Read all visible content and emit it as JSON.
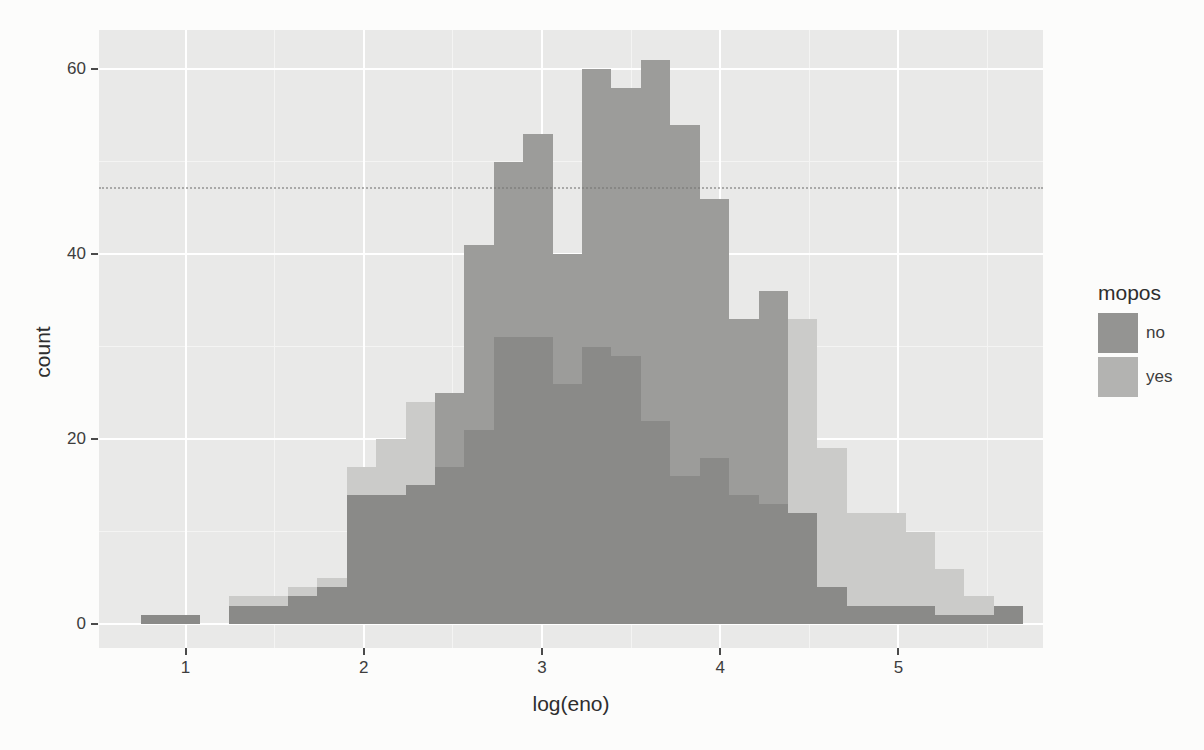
{
  "page": {
    "background": "#fcfcfb"
  },
  "panel": {
    "background": "#e9e9e8",
    "gridline_major_color": "#ffffff",
    "gridline_minor_color": "#f4f4f3"
  },
  "colors": {
    "no_only": "#9c9c9a",
    "yes_only": "#cbcbc9",
    "overlap": "#8a8a88",
    "axis_text": "#3d3d3d",
    "tick_mark": "#4a4a4a",
    "artifact_line": "#767674"
  },
  "axes": {
    "x": {
      "title": "log(eno)",
      "tick_labels": [
        "1",
        "2",
        "3",
        "4",
        "5"
      ],
      "tick_values": [
        1,
        2,
        3,
        4,
        5
      ],
      "minor_tick_values": [
        1.5,
        2.5,
        3.5,
        4.5,
        5.5
      ]
    },
    "y": {
      "title": "count",
      "tick_labels": [
        "0",
        "20",
        "40",
        "60"
      ],
      "tick_values": [
        0,
        20,
        40,
        60
      ],
      "minor_tick_values": [
        10,
        30,
        50
      ]
    }
  },
  "legend": {
    "title": "mopos",
    "items": [
      {
        "label": "no",
        "color": "#949492"
      },
      {
        "label": "yes",
        "color": "#b3b3b1"
      }
    ]
  },
  "chart_data": {
    "type": "bar",
    "subtype": "overlaid-histogram-position-identity",
    "title": "",
    "xlabel": "log(eno)",
    "ylabel": "count",
    "xlim": [
      0.55,
      5.79
    ],
    "ylim": [
      -2.6,
      64.2
    ],
    "grid": "on",
    "legend_position": "right",
    "legend_title": "mopos",
    "bin_width": 0.165,
    "bin_left_edges": [
      0.75,
      0.915,
      1.08,
      1.245,
      1.41,
      1.575,
      1.74,
      1.905,
      2.07,
      2.235,
      2.4,
      2.565,
      2.73,
      2.895,
      3.06,
      3.225,
      3.39,
      3.555,
      3.72,
      3.885,
      4.05,
      4.215,
      4.38,
      4.545,
      4.71,
      4.875,
      5.04,
      5.205,
      5.37,
      5.535
    ],
    "series": [
      {
        "name": "no",
        "values": [
          1,
          1,
          0,
          2,
          2,
          3,
          4,
          14,
          14,
          15,
          25,
          41,
          50,
          53,
          40,
          60,
          58,
          61,
          54,
          46,
          33,
          36,
          12,
          4,
          2,
          2,
          2,
          1,
          1,
          2
        ]
      },
      {
        "name": "yes",
        "values": [
          1,
          1,
          0,
          3,
          3,
          4,
          5,
          17,
          20,
          24,
          17,
          21,
          31,
          31,
          26,
          30,
          29,
          22,
          16,
          18,
          14,
          13,
          33,
          19,
          12,
          12,
          10,
          6,
          3,
          2
        ]
      }
    ],
    "artifact_line_count": 47.2
  }
}
